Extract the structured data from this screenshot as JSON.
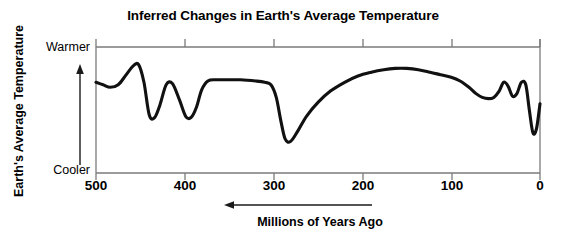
{
  "chart_data": {
    "type": "line",
    "title": "Inferred Changes in Earth's Average Temperature",
    "xlabel": "Millions of Years Ago",
    "ylabel": "Earth's Average Temperature",
    "xlim": [
      500,
      0
    ],
    "x_tick_labels": [
      "500",
      "400",
      "300",
      "200",
      "100",
      "0"
    ],
    "x_ticks": [
      500,
      400,
      300,
      200,
      100,
      0
    ],
    "x_axis_direction_note": "Arrow below axis points left toward older ages",
    "ylim_labels": [
      "Cooler",
      "Warmer"
    ],
    "y_tick_labels": [
      "Warmer",
      "Cooler"
    ],
    "y_axis_arrow": "upward arrow indicating increasing temperature",
    "grid": false,
    "legend": null,
    "series": [
      {
        "name": "Inferred global average temperature",
        "x": [
          500,
          492,
          484,
          475,
          466,
          458,
          452,
          446,
          440,
          434,
          428,
          421,
          414,
          406,
          399,
          393,
          387,
          381,
          374,
          365,
          352,
          337,
          320,
          310,
          303,
          297,
          292,
          287,
          281,
          273,
          263,
          250,
          236,
          220,
          205,
          190,
          176,
          163,
          150,
          137,
          124,
          112,
          100,
          90,
          80,
          72,
          65,
          58,
          52,
          46,
          41,
          36,
          31,
          26,
          21,
          16,
          12,
          8,
          4,
          0
        ],
        "y": [
          0.72,
          0.7,
          0.68,
          0.7,
          0.78,
          0.85,
          0.86,
          0.72,
          0.46,
          0.44,
          0.54,
          0.7,
          0.71,
          0.58,
          0.45,
          0.44,
          0.52,
          0.66,
          0.73,
          0.74,
          0.74,
          0.74,
          0.73,
          0.72,
          0.7,
          0.6,
          0.42,
          0.27,
          0.25,
          0.33,
          0.45,
          0.56,
          0.65,
          0.72,
          0.77,
          0.8,
          0.82,
          0.83,
          0.83,
          0.82,
          0.8,
          0.78,
          0.76,
          0.73,
          0.68,
          0.63,
          0.6,
          0.59,
          0.6,
          0.65,
          0.72,
          0.69,
          0.61,
          0.63,
          0.72,
          0.7,
          0.5,
          0.32,
          0.35,
          0.55
        ],
        "y_units": "relative (0 = Cooler baseline, 1 = Warmer top)"
      }
    ],
    "features": [
      {
        "label": "peak",
        "x": 452,
        "level": "warm"
      },
      {
        "label": "trough",
        "x": 440,
        "level": "cool"
      },
      {
        "label": "peak",
        "x": 421,
        "level": "mid-warm"
      },
      {
        "label": "trough",
        "x": 396,
        "level": "cool"
      },
      {
        "label": "plateau",
        "x": 360,
        "level": "warm"
      },
      {
        "label": "deep trough",
        "x": 290,
        "level": "coldest"
      },
      {
        "label": "broad warm hump",
        "x": 165,
        "level": "warmest"
      },
      {
        "label": "dip",
        "x": 58,
        "level": "mid"
      },
      {
        "label": "peak",
        "x": 44,
        "level": "warm"
      },
      {
        "label": "dip",
        "x": 33,
        "level": "mid"
      },
      {
        "label": "peak",
        "x": 24,
        "level": "warm"
      },
      {
        "label": "deep trough",
        "x": 10,
        "level": "cold"
      },
      {
        "label": "rise at present",
        "x": 0,
        "level": "mid"
      }
    ]
  },
  "style": {
    "line_color": "#111111",
    "frame_color": "#7a7a7a",
    "text_color": "#000000",
    "background": "#ffffff"
  }
}
